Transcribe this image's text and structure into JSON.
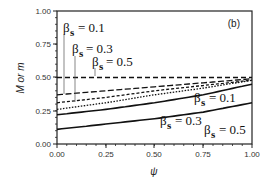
{
  "chart_data": {
    "type": "line",
    "title": "",
    "panel_label": "(b)",
    "xlabel": "ψ",
    "ylabel": "M or m",
    "xlim": [
      0,
      1
    ],
    "ylim": [
      0,
      1
    ],
    "xticks": [
      "0.00",
      "0.25",
      "0.50",
      "0.75",
      "1.00"
    ],
    "yticks": [
      "0.00",
      "0.25",
      "0.50",
      "0.75",
      "1.00"
    ],
    "grid": false,
    "x": [
      0.0,
      0.25,
      0.5,
      0.75,
      1.0
    ],
    "series": [
      {
        "name": "M, βs = 0.1",
        "style": "dashed",
        "values": [
          0.5,
          0.5,
          0.5,
          0.5,
          0.5
        ]
      },
      {
        "name": "M, βs = 0.3",
        "style": "long-dashed",
        "values": [
          0.37,
          0.4,
          0.43,
          0.46,
          0.49
        ]
      },
      {
        "name": "M, βs = 0.5",
        "style": "short-dashed",
        "values": [
          0.31,
          0.35,
          0.4,
          0.44,
          0.48
        ]
      },
      {
        "name": "dotted",
        "style": "dotted",
        "values": [
          0.26,
          0.31,
          0.37,
          0.42,
          0.48
        ]
      },
      {
        "name": "m, βs = 0.1",
        "style": "solid",
        "values": [
          0.22,
          0.26,
          0.31,
          0.37,
          0.45
        ]
      },
      {
        "name": "m, βs = 0.3/0.5",
        "style": "solid",
        "values": [
          0.11,
          0.15,
          0.19,
          0.24,
          0.31
        ]
      }
    ],
    "annotations": [
      {
        "text": "βs = 0.1",
        "group": "upper"
      },
      {
        "text": "βs = 0.3",
        "group": "upper"
      },
      {
        "text": "βs = 0.5",
        "group": "upper"
      },
      {
        "text": "βs = 0.1",
        "group": "lower"
      },
      {
        "text": "βs = 0.3",
        "group": "lower"
      },
      {
        "text": "βs = 0.5",
        "group": "lower"
      }
    ]
  },
  "labels": {
    "beta": "β",
    "s": "s",
    "u1": "= 0.1",
    "u2": "= 0.3",
    "u3": "= 0.5",
    "l1": "= 0.1",
    "l2": "= 0.3",
    "l3": "= 0.5"
  }
}
